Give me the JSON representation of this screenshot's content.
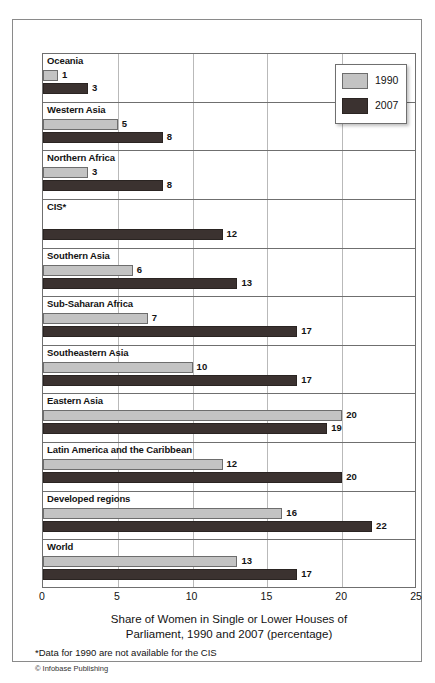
{
  "chart_data": {
    "type": "bar",
    "orientation": "horizontal",
    "title": "Share of Women in Single or Lower Houses of Parliament, 1990 and 2007 (percentage)",
    "title_line1": "Share of Women in Single or Lower Houses of",
    "title_line2": "Parliament, 1990 and 2007 (percentage)",
    "xlabel": "",
    "ylabel": "",
    "xlim": [
      0,
      25
    ],
    "xticks": [
      "0",
      "5",
      "10",
      "15",
      "20",
      "25"
    ],
    "xtick_values": [
      0,
      5,
      10,
      15,
      20,
      25
    ],
    "grid": true,
    "legend_position": "top-right",
    "categories": [
      "Oceania",
      "Western Asia",
      "Northern Africa",
      "CIS*",
      "Southern Asia",
      "Sub-Saharan Africa",
      "Southeastern Asia",
      "Eastern Asia",
      "Latin America and the Caribbean",
      "Developed regions",
      "World"
    ],
    "series": [
      {
        "name": "1990",
        "color": "#c3c3c3",
        "values": [
          1,
          5,
          3,
          null,
          6,
          7,
          10,
          20,
          12,
          16,
          13
        ]
      },
      {
        "name": "2007",
        "color": "#3b3230",
        "values": [
          3,
          8,
          8,
          12,
          13,
          17,
          17,
          19,
          20,
          22,
          17
        ]
      }
    ],
    "footnote": "*Data for 1990 are not available for the CIS",
    "credit": "© Infobase Publishing"
  },
  "legend": {
    "entries": [
      {
        "label": "1990",
        "swatch": "light-gray"
      },
      {
        "label": "2007",
        "swatch": "dark-brown"
      }
    ]
  }
}
